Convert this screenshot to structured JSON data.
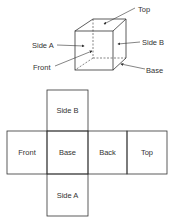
{
  "cube": {
    "labels": {
      "top": "Top",
      "side_a": "Side A",
      "side_b": "Side B",
      "front": "Front",
      "base": "Base"
    }
  },
  "net": {
    "faces": [
      {
        "id": "side-b",
        "label": "Side B"
      },
      {
        "id": "front",
        "label": "Front"
      },
      {
        "id": "base",
        "label": "Base"
      },
      {
        "id": "back",
        "label": "Back"
      },
      {
        "id": "top",
        "label": "Top"
      },
      {
        "id": "side-a",
        "label": "Side A"
      }
    ]
  },
  "colors": {
    "line": "#333333",
    "background": "#ffffff"
  }
}
